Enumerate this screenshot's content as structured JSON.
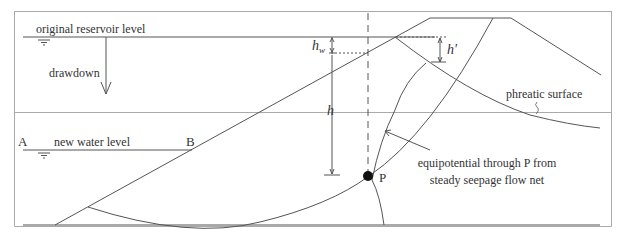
{
  "figure": {
    "labels": {
      "original_reservoir_level": "original reservoir level",
      "drawdown": "drawdown",
      "new_water_level": "new water level",
      "point_A": "A",
      "point_B": "B",
      "point_P": "P",
      "phreatic_surface": "phreatic surface",
      "equipotential_line1": "equipotential through P from",
      "equipotential_line2": "steady seepage flow net",
      "h_w": "h",
      "h_w_sub": "w",
      "h": "h",
      "h_prime": "h′"
    },
    "colors": {
      "line": "#555555",
      "border": "#999999",
      "point": "#111111",
      "text": "#333333"
    }
  }
}
